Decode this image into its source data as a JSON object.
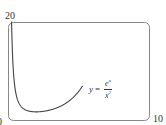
{
  "chart_data": {
    "type": "line",
    "title": "",
    "function": "y = e^x / x^2",
    "xlabel": "",
    "ylabel": "",
    "xlim": [
      0,
      10
    ],
    "ylim": [
      0,
      20
    ],
    "tick_labels": {
      "y_top": "20",
      "x_left": "0",
      "x_right": "10"
    },
    "grid": false,
    "series": [
      {
        "name": "y = e^x / x^2",
        "x": [
          0.3,
          0.4,
          0.5,
          0.7,
          1.0,
          1.5,
          2.0,
          2.5,
          3.0,
          3.5,
          4.0,
          4.5,
          5.0,
          5.2
        ],
        "values": [
          15.0,
          9.3,
          6.6,
          4.1,
          2.72,
          1.99,
          1.85,
          1.95,
          2.23,
          2.7,
          3.41,
          4.45,
          5.94,
          6.7
        ]
      }
    ],
    "annotation": {
      "text_y": "y",
      "eq": "=",
      "numerator": "e",
      "numerator_exp": "x",
      "denominator": "x",
      "denominator_exp": "2"
    }
  }
}
